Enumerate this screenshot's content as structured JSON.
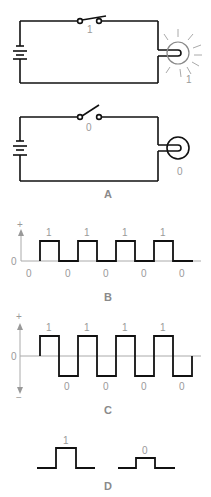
{
  "panels": {
    "A": {
      "caption": "A",
      "circuit_on": {
        "switch_state_label": "1",
        "bulb_state_label": "1",
        "switch": "closed",
        "bulb": "lit"
      },
      "circuit_off": {
        "switch_state_label": "0",
        "bulb_state_label": "0",
        "switch": "open",
        "bulb": "unlit"
      }
    },
    "B": {
      "caption": "B",
      "axis_plus": "+",
      "axis_zero": "0",
      "high_labels": [
        "1",
        "1",
        "1",
        "1"
      ],
      "low_labels": [
        "0",
        "0",
        "0",
        "0",
        "0"
      ]
    },
    "C": {
      "caption": "C",
      "axis_plus": "+",
      "axis_zero": "0",
      "axis_minus": "−",
      "high_labels": [
        "1",
        "1",
        "1",
        "1"
      ],
      "low_labels": [
        "0",
        "0",
        "0",
        "0"
      ]
    },
    "D": {
      "caption": "D",
      "pulse_labels": [
        "1",
        "0"
      ]
    }
  },
  "colors": {
    "line": "#111111",
    "label": "#9a9a9a",
    "axis": "#aaaaaa"
  }
}
